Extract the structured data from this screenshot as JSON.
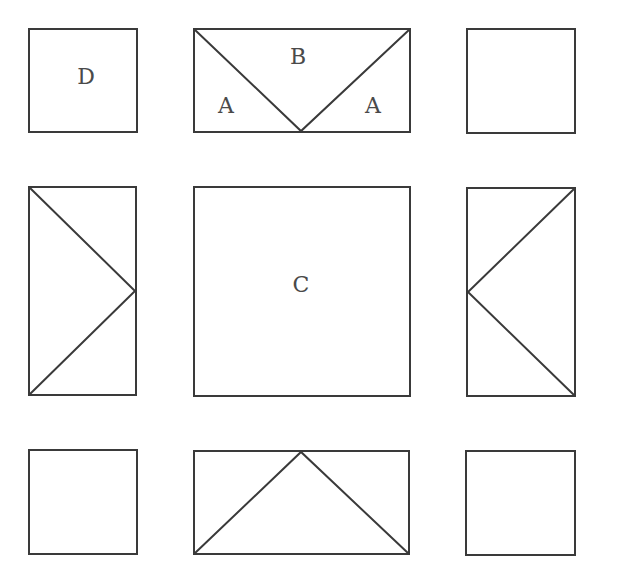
{
  "diagram": {
    "type": "quilt-block-layout",
    "stroke_color": "#3a3a3a",
    "stroke_width": 2,
    "background": "#ffffff",
    "labels": {
      "top_left_square": "D",
      "top_flying_geese_center": "B",
      "top_flying_geese_left": "A",
      "top_flying_geese_right": "A",
      "center_square": "C"
    },
    "pieces": [
      {
        "id": "top-left-square",
        "kind": "square",
        "x": 29,
        "y": 29,
        "w": 108,
        "h": 103,
        "label": "D"
      },
      {
        "id": "top-flying-geese",
        "kind": "rect-with-v",
        "x": 194,
        "y": 29,
        "w": 216,
        "h": 103,
        "orientation": "down",
        "labels": [
          "A",
          "B",
          "A"
        ]
      },
      {
        "id": "top-right-square",
        "kind": "square",
        "x": 467,
        "y": 29,
        "w": 108,
        "h": 104
      },
      {
        "id": "middle-left-flying-geese",
        "kind": "rect-with-v",
        "x": 29,
        "y": 187,
        "w": 107,
        "h": 208,
        "orientation": "right"
      },
      {
        "id": "center-square",
        "kind": "square",
        "x": 194,
        "y": 187,
        "w": 216,
        "h": 209,
        "label": "C"
      },
      {
        "id": "middle-right-flying-geese",
        "kind": "rect-with-v",
        "x": 467,
        "y": 188,
        "w": 108,
        "h": 208,
        "orientation": "left"
      },
      {
        "id": "bottom-left-square",
        "kind": "square",
        "x": 29,
        "y": 450,
        "w": 108,
        "h": 104
      },
      {
        "id": "bottom-flying-geese",
        "kind": "rect-with-v",
        "x": 194,
        "y": 451,
        "w": 215,
        "h": 103,
        "orientation": "up"
      },
      {
        "id": "bottom-right-square",
        "kind": "square",
        "x": 466,
        "y": 451,
        "w": 109,
        "h": 104
      }
    ]
  }
}
